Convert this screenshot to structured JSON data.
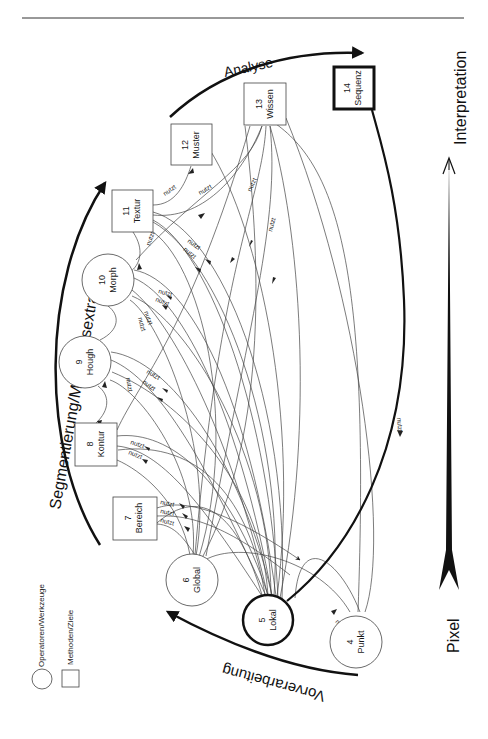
{
  "diagram": {
    "orientation": "rotated-90-ccw",
    "stages": [
      {
        "id": "vorverarbeitung",
        "label": "Vorverarbeitung"
      },
      {
        "id": "segmentierung",
        "label": "Segmentierung/Merkmalsextraktion"
      },
      {
        "id": "analyse",
        "label": "Analyse"
      }
    ],
    "axis": {
      "low_label": "Pixel",
      "high_label": "Interpretation"
    },
    "legend": [
      {
        "shape": "circle",
        "label": "Operatoren/Werkzeuge"
      },
      {
        "shape": "square",
        "label": "Methoden/Ziele"
      }
    ],
    "nodes": [
      {
        "id": 4,
        "num": "4",
        "name": "Punkt",
        "shape": "circle"
      },
      {
        "id": 5,
        "num": "5",
        "name": "Lokal",
        "shape": "circle",
        "emphasis": "bold"
      },
      {
        "id": 6,
        "num": "6",
        "name": "Global",
        "shape": "circle"
      },
      {
        "id": 7,
        "num": "7",
        "name": "Bereich",
        "shape": "square"
      },
      {
        "id": 8,
        "num": "8",
        "name": "Kontur",
        "shape": "square"
      },
      {
        "id": 9,
        "num": "9",
        "name": "Hough",
        "shape": "circle"
      },
      {
        "id": 10,
        "num": "10",
        "name": "Morph",
        "shape": "circle"
      },
      {
        "id": 11,
        "num": "11",
        "name": "Textur",
        "shape": "square"
      },
      {
        "id": 12,
        "num": "12",
        "name": "Muster",
        "shape": "square"
      },
      {
        "id": 13,
        "num": "13",
        "name": "Wissen",
        "shape": "square"
      },
      {
        "id": 14,
        "num": "14",
        "name": "Sequenz",
        "shape": "square",
        "emphasis": "bold"
      }
    ],
    "edge_label": "nutzt"
  }
}
